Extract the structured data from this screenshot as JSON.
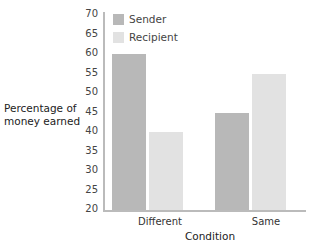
{
  "chart_data": {
    "type": "bar",
    "title": "",
    "xlabel": "Condition",
    "ylabel": "Percentage of money earned",
    "ylabel_lines": [
      "Percentage of",
      "money earned"
    ],
    "ylim": [
      20,
      70
    ],
    "yticks": [
      20,
      25,
      30,
      35,
      40,
      45,
      50,
      55,
      60,
      65,
      70
    ],
    "categories": [
      "Different",
      "Same"
    ],
    "series": [
      {
        "name": "Sender",
        "values": [
          60,
          45
        ],
        "color": "#b8b8b8"
      },
      {
        "name": "Recipient",
        "values": [
          40,
          55
        ],
        "color": "#e2e2e2"
      }
    ],
    "legend_position": "top-left inside",
    "grid": false
  }
}
